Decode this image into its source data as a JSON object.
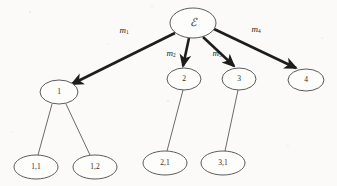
{
  "diagram": {
    "type": "tree",
    "title": "",
    "root": {
      "id": "root",
      "label": "ℰ",
      "name": "root-node-epsilon",
      "cx": 193,
      "cy": 23,
      "rx": 23,
      "ry": 15,
      "font_size": 11
    },
    "level1_nodes": [
      {
        "id": "n1",
        "label": "1",
        "name": "node-1",
        "cx": 59,
        "cy": 92,
        "rx": 19,
        "ry": 12,
        "font_size": 7.5
      },
      {
        "id": "n2",
        "label": "2",
        "name": "node-2",
        "cx": 184,
        "cy": 79,
        "rx": 17,
        "ry": 11,
        "font_size": 7.5
      },
      {
        "id": "n3",
        "label": "3",
        "name": "node-3",
        "cx": 239,
        "cy": 79,
        "rx": 17,
        "ry": 11,
        "font_size": 7.5
      },
      {
        "id": "n4",
        "label": "4",
        "name": "node-4",
        "cx": 306,
        "cy": 80,
        "rx": 18,
        "ry": 11,
        "font_size": 7.5
      }
    ],
    "level2_nodes": [
      {
        "id": "n11",
        "label": "1,1",
        "name": "node-1-1",
        "cx": 36,
        "cy": 167,
        "rx": 22,
        "ry": 12,
        "font_size": 7.5
      },
      {
        "id": "n12",
        "label": "1,2",
        "name": "node-1-2",
        "cx": 95,
        "cy": 167,
        "rx": 22,
        "ry": 12,
        "font_size": 7.5
      },
      {
        "id": "n21",
        "label": "2,1",
        "name": "node-2-1",
        "cx": 165,
        "cy": 163,
        "rx": 22,
        "ry": 12,
        "font_size": 7.5
      },
      {
        "id": "n31",
        "label": "3,1",
        "name": "node-3-1",
        "cx": 223,
        "cy": 163,
        "rx": 22,
        "ry": 12,
        "font_size": 7.5
      }
    ],
    "thick_edges": [
      {
        "name": "edge-root-to-1",
        "from": "root",
        "to": "n1",
        "x1": 175,
        "y1": 33,
        "x2": 72,
        "y2": 84,
        "arrow": true
      },
      {
        "name": "edge-root-to-2",
        "from": "root",
        "to": "n2",
        "x1": 189,
        "y1": 38,
        "x2": 183,
        "y2": 66,
        "arrow": true
      },
      {
        "name": "edge-root-to-3",
        "from": "root",
        "to": "n3",
        "x1": 203,
        "y1": 37,
        "x2": 234,
        "y2": 66,
        "arrow": true
      },
      {
        "name": "edge-root-to-4",
        "from": "root",
        "to": "n4",
        "x1": 214,
        "y1": 29,
        "x2": 296,
        "y2": 68,
        "arrow": true
      }
    ],
    "thin_edges": [
      {
        "name": "edge-1-to-1-1",
        "from": "n1",
        "to": "n11",
        "x1": 52,
        "y1": 104,
        "x2": 38,
        "y2": 155
      },
      {
        "name": "edge-1-to-1-2",
        "from": "n1",
        "to": "n12",
        "x1": 66,
        "y1": 104,
        "x2": 90,
        "y2": 155
      },
      {
        "name": "edge-2-to-2-1",
        "from": "n2",
        "to": "n21",
        "x1": 183,
        "y1": 90,
        "x2": 167,
        "y2": 151
      },
      {
        "name": "edge-3-to-3-1",
        "from": "n3",
        "to": "n31",
        "x1": 238,
        "y1": 90,
        "x2": 225,
        "y2": 151
      }
    ],
    "edge_labels": [
      {
        "name": "edge-label-m1",
        "base": "m",
        "sub": "1",
        "x": 124,
        "y": 31,
        "font_size": 9
      },
      {
        "name": "edge-label-m2",
        "base": "m",
        "sub": "2",
        "x": 171,
        "y": 54,
        "font_size": 9
      },
      {
        "name": "edge-label-m3",
        "base": "m",
        "sub": "3",
        "x": 217,
        "y": 54,
        "font_size": 9
      },
      {
        "name": "edge-label-m4",
        "base": "m",
        "sub": "4",
        "x": 256,
        "y": 30,
        "font_size": 9
      }
    ],
    "colors": {
      "background": "#fbfaf8",
      "node_stroke": "#4a4a4a",
      "node_fill": "#fdfdfc",
      "thick_edge": "#1d1d1d",
      "thin_edge": "#5a5a5a",
      "text": "#2b2b2b"
    }
  }
}
